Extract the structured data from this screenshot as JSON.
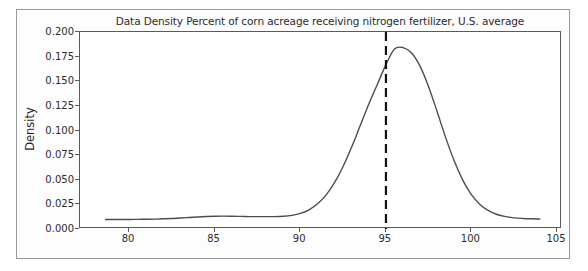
{
  "figure": {
    "title": "Data Density Percent of corn acreage receiving nitrogen fertilizer, U.S. average",
    "background_color": "#ffffff",
    "frame_color": "#9a9a9a"
  },
  "axes": {
    "y_axis_label": "Density",
    "x_tick_labels": [
      "80",
      "85",
      "90",
      "95",
      "100",
      "105"
    ],
    "y_tick_labels": [
      "0.000",
      "0.025",
      "0.050",
      "0.075",
      "0.100",
      "0.125",
      "0.150",
      "0.175",
      "0.200"
    ]
  },
  "annotations": {
    "vline_label": "95",
    "vline_style": "dashed",
    "vline_color": "#111111"
  },
  "chart_data": {
    "type": "line",
    "title": "Data Density Percent of corn acreage receiving nitrogen fertilizer, U.S. average",
    "xlabel": "",
    "ylabel": "Density",
    "xlim": [
      77.1,
      105.3
    ],
    "ylim": [
      -0.009,
      0.2115
    ],
    "grid": false,
    "legend": null,
    "x_ticks": [
      80,
      85,
      90,
      95,
      100,
      105
    ],
    "y_ticks": [
      0.0,
      0.025,
      0.05,
      0.075,
      0.1,
      0.125,
      0.15,
      0.175,
      0.2
    ],
    "line_color": "#4d4d4d",
    "series": [
      {
        "name": "Density",
        "x": [
          78.6,
          79.0,
          79.5,
          80.0,
          80.5,
          81.0,
          81.5,
          82.0,
          82.5,
          83.0,
          83.5,
          84.0,
          84.5,
          85.0,
          85.5,
          86.0,
          86.5,
          87.0,
          87.5,
          88.0,
          88.5,
          89.0,
          89.5,
          90.0,
          90.5,
          91.0,
          91.5,
          92.0,
          92.5,
          93.0,
          93.5,
          94.0,
          94.5,
          95.0,
          95.5,
          96.0,
          96.5,
          97.0,
          97.5,
          98.0,
          98.5,
          99.0,
          99.5,
          100.0,
          100.5,
          101.0,
          101.5,
          102.0,
          102.5,
          103.0,
          103.5,
          104.0
        ],
        "y": [
          0.0016,
          0.0016,
          0.0016,
          0.0017,
          0.0018,
          0.0019,
          0.0021,
          0.0024,
          0.0028,
          0.0033,
          0.0039,
          0.0045,
          0.005,
          0.0053,
          0.0054,
          0.0053,
          0.0051,
          0.0049,
          0.0048,
          0.0048,
          0.0049,
          0.0053,
          0.0063,
          0.0085,
          0.0125,
          0.0192,
          0.0292,
          0.0432,
          0.0613,
          0.083,
          0.107,
          0.131,
          0.153,
          0.175,
          0.1925,
          0.194,
          0.188,
          0.173,
          0.15,
          0.122,
          0.093,
          0.067,
          0.0455,
          0.0295,
          0.0185,
          0.0115,
          0.0072,
          0.0048,
          0.0035,
          0.0028,
          0.0024,
          0.0022
        ]
      }
    ],
    "annotations": [
      {
        "type": "vline",
        "x": 95,
        "style": "dashed",
        "color": "#111111",
        "linewidth": 2
      }
    ],
    "peak": {
      "x": 95.8,
      "y": 0.194
    }
  }
}
